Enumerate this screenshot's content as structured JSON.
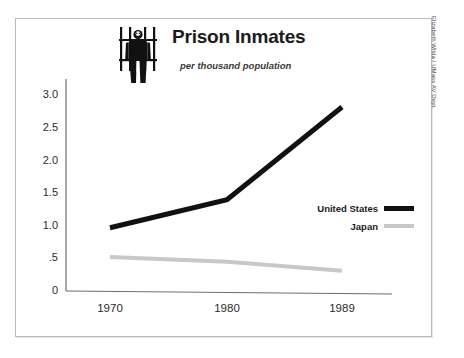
{
  "chart_data": {
    "type": "line",
    "title": "Prison Inmates",
    "subtitle": "per thousand population",
    "xlabel": "",
    "ylabel": "",
    "categories": [
      "1970",
      "1980",
      "1989"
    ],
    "x": [
      1970,
      1980,
      1989
    ],
    "series": [
      {
        "name": "United States",
        "values": [
          0.97,
          1.4,
          2.82
        ],
        "color": "#111111"
      },
      {
        "name": "Japan",
        "values": [
          0.52,
          0.45,
          0.31
        ],
        "color": "#c8c8c8"
      }
    ],
    "ylim": [
      0,
      3.25
    ],
    "yticks": [
      "0",
      ".5",
      "1.0",
      "1.5",
      "2.0",
      "2.5",
      "3.0"
    ],
    "ytick_values": [
      0,
      0.5,
      1.0,
      1.5,
      2.0,
      2.5,
      3.0
    ],
    "xticks": [
      "1970",
      "1980",
      "1989"
    ],
    "grid": false,
    "legend_position": "right-middle"
  },
  "legend": {
    "entries": [
      {
        "label": "United States",
        "color": "#111111"
      },
      {
        "label": "Japan",
        "color": "#c8c8c8"
      }
    ]
  },
  "icon": {
    "name": "prisoner-behind-bars-icon"
  },
  "credit": {
    "text": "Elizabeth Wilda / UMass AV Dept."
  },
  "colors": {
    "frame": "#b9b9b9",
    "axis": "#6e6e6e",
    "us_line": "#111111",
    "japan_line": "#c8c8c8",
    "text": "#1b1b1b",
    "background": "#ffffff"
  }
}
